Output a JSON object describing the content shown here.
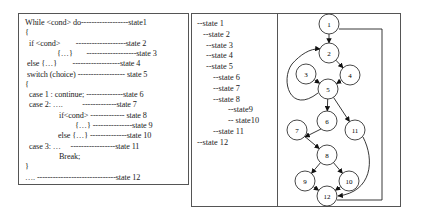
{
  "code": {
    "lines": [
      {
        "text": "While <cond> do------------------state1",
        "indent": 0
      },
      {
        "text": "{",
        "indent": 0
      },
      {
        "text": "if <cond>        -------------------state 2",
        "indent": 4
      },
      {
        "text": "{…}       -------------------state 3",
        "indent": 32
      },
      {
        "text": "else {…}        ------------------state 4",
        "indent": 2
      },
      {
        "text": "switch (choice) ------------------ state 5",
        "indent": 2
      },
      {
        "text": "{",
        "indent": 0
      },
      {
        "text": "case 1 : continue; --------------state 6",
        "indent": 4
      },
      {
        "text": "case 2: ….          -------------state 7",
        "indent": 4
      },
      {
        "text": "if<cond> ------------- state 8",
        "indent": 34
      },
      {
        "text": "{…} ---------------state 9",
        "indent": 50
      },
      {
        "text": "else {…} --------------state 10",
        "indent": 33
      },
      {
        "text": "case 3: …     -----------------state 11",
        "indent": 4
      },
      {
        "text": "Break;",
        "indent": 34
      },
      {
        "text": "}",
        "indent": 0
      },
      {
        "text": "…. ------------------------------state 12",
        "indent": 0
      }
    ]
  },
  "tree": {
    "lines": [
      {
        "text": "--state 1",
        "indent": 0
      },
      {
        "text": "--state 2",
        "indent": 6
      },
      {
        "text": "--state 3",
        "indent": 9
      },
      {
        "text": "--state 4",
        "indent": 9
      },
      {
        "text": "--state 5",
        "indent": 9
      },
      {
        "text": "--state 6",
        "indent": 16
      },
      {
        "text": "--state 7",
        "indent": 16
      },
      {
        "text": "--state 8",
        "indent": 16
      },
      {
        "text": "--state9",
        "indent": 31
      },
      {
        "text": "-- state10",
        "indent": 31
      },
      {
        "text": "--state 11",
        "indent": 16
      },
      {
        "text": "--state 12",
        "indent": 0
      }
    ]
  },
  "graph": {
    "nodes": [
      {
        "id": "1",
        "x": 329,
        "y": 24
      },
      {
        "id": "2",
        "x": 329,
        "y": 53
      },
      {
        "id": "3",
        "x": 306,
        "y": 74
      },
      {
        "id": "4",
        "x": 350,
        "y": 75
      },
      {
        "id": "5",
        "x": 328,
        "y": 89
      },
      {
        "id": "6",
        "x": 327,
        "y": 121
      },
      {
        "id": "7",
        "x": 297,
        "y": 130
      },
      {
        "id": "11",
        "x": 355,
        "y": 130
      },
      {
        "id": "8",
        "x": 327,
        "y": 155
      },
      {
        "id": "9",
        "x": 305,
        "y": 181
      },
      {
        "id": "10",
        "x": 349,
        "y": 181
      },
      {
        "id": "12",
        "x": 327,
        "y": 196
      }
    ]
  }
}
